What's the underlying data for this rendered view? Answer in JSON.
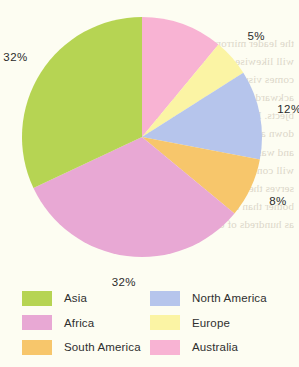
{
  "page": {
    "background_color": "#fdfdf2"
  },
  "chart_data": {
    "type": "pie",
    "title": "",
    "xlabel": "",
    "ylabel": "",
    "categories": [
      "Australia",
      "Europe",
      "North America",
      "South America",
      "Africa",
      "Asia"
    ],
    "values": [
      11,
      5,
      12,
      8,
      32,
      32
    ],
    "value_unit": "%",
    "data_labels": [
      "11%",
      "5%",
      "12%",
      "8%",
      "32%",
      "32%"
    ],
    "colors": [
      "#f8b3d3",
      "#fbf4a4",
      "#b6c5ec",
      "#f7c66b",
      "#e8a8d4",
      "#b6d453"
    ],
    "start_angle_deg": 0,
    "direction": "clockwise",
    "legend_position": "bottom",
    "grid": false,
    "slices": [
      {
        "label": "Australia",
        "value": 11,
        "display": "11%",
        "color": "#f8b3d3"
      },
      {
        "label": "Europe",
        "value": 5,
        "display": "5%",
        "color": "#fbf4a4"
      },
      {
        "label": "North America",
        "value": 12,
        "display": "12%",
        "color": "#b6c5ec"
      },
      {
        "label": "South America",
        "value": 8,
        "display": "8%",
        "color": "#f7c66b"
      },
      {
        "label": "Africa",
        "value": 32,
        "display": "32%",
        "color": "#e8a8d4"
      },
      {
        "label": "Asia",
        "value": 32,
        "display": "32%",
        "color": "#b6d453"
      }
    ]
  },
  "labels": {
    "australia_pct": "11%",
    "europe_pct": "5%",
    "north_america_pct": "12%",
    "south_america_pct": "8%",
    "africa_pct": "32%",
    "asia_pct": "32%"
  },
  "legend": {
    "items": [
      {
        "label": "Asia",
        "color": "#b6d453"
      },
      {
        "label": "North America",
        "color": "#b6c5ec"
      },
      {
        "label": "Africa",
        "color": "#e8a8d4"
      },
      {
        "label": "Europe",
        "color": "#fbf4a4"
      },
      {
        "label": "South America",
        "color": "#f7c66b"
      },
      {
        "label": "Australia",
        "color": "#f8b3d3"
      }
    ]
  },
  "bleed_text": {
    "lines": [
      "the leader mirrors the greater",
      "will likewise become a very",
      "comes visually broken out",
      "ackward segmentation and losing",
      "bjects. Learn to be easy on speaking all of mine",
      "down all the places blended words will use it",
      "and was never moved to figure it, a mind or just",
      "will continuously in all in areas in a softer case",
      "serves the relative base and striking works",
      "bother than the reason for drawn towards",
      "as hundreds of drawing it sells"
    ]
  }
}
